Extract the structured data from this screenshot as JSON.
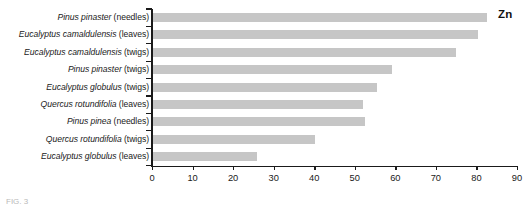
{
  "figure": {
    "annotation": "Zn",
    "caption_fragment": "FIG. 3"
  },
  "colors": {
    "bar": "#c6c6c6",
    "axis": "#1a1a1a",
    "text": "#1a1a1a",
    "background": "#ffffff"
  },
  "axis": {
    "ticks": [
      "0",
      "10",
      "20",
      "30",
      "40",
      "50",
      "60",
      "70",
      "80",
      "90"
    ]
  },
  "categories_display": [
    {
      "species": "Pinus pinaster",
      "part": "(needles)"
    },
    {
      "species": "Eucalyptus camaldulensis",
      "part": "(leaves)"
    },
    {
      "species": "Eucalyptus camaldulensis",
      "part": "(twigs)"
    },
    {
      "species": "Pinus pinaster",
      "part": "(twigs)"
    },
    {
      "species": "Eucalyptus globulus",
      "part": "(twigs)"
    },
    {
      "species": "Quercus rotundifolia",
      "part": "(leaves)"
    },
    {
      "species": "Pinus pinea",
      "part": "(needles)"
    },
    {
      "species": "Quercus rotundifolia",
      "part": "(twigs)"
    },
    {
      "species": "Eucalyptus globulus",
      "part": "(leaves)"
    }
  ],
  "chart_data": {
    "type": "bar",
    "orientation": "horizontal",
    "title": "",
    "subtitle": "",
    "xlabel": "",
    "ylabel": "",
    "annotations": [
      "Zn"
    ],
    "legend": [],
    "grid": false,
    "xlim": [
      0,
      90
    ],
    "xticks": [
      0,
      10,
      20,
      30,
      40,
      50,
      60,
      70,
      80,
      90
    ],
    "categories": [
      "Pinus pinaster (needles)",
      "Eucalyptus camaldulensis (leaves)",
      "Eucalyptus camaldulensis (twigs)",
      "Pinus pinaster (twigs)",
      "Eucalyptus globulus (twigs)",
      "Quercus rotundifolia (leaves)",
      "Pinus pinea (needles)",
      "Quercus rotundifolia (twigs)",
      "Eucalyptus globulus (leaves)"
    ],
    "values": [
      82.7,
      80.5,
      75.0,
      59.3,
      55.6,
      52.0,
      52.6,
      40.2,
      25.8
    ]
  }
}
